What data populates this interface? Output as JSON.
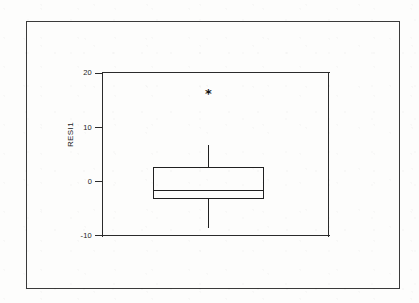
{
  "figure": {
    "background_color": "#fdfdfc",
    "ink_color": "#202020",
    "border_color": "#3a3a3a",
    "outlier_glyph": "*",
    "axis_title": "RESI1"
  },
  "chart_data": {
    "type": "box",
    "title": "",
    "xlabel": "",
    "ylabel": "RESI1",
    "ylim": [
      -10,
      20
    ],
    "yticks": [
      -10,
      0,
      10,
      20
    ],
    "ytick_labels": [
      "-10",
      "0",
      "10",
      "20"
    ],
    "grid": false,
    "legend": false,
    "orientation": "vertical",
    "categories": [
      ""
    ],
    "series": [
      {
        "name": "RESI1",
        "min_whisker": -8.7,
        "q1": -3.3,
        "median": -1.7,
        "q3": 2.6,
        "max_whisker": 6.7,
        "outliers": [
          16.5
        ]
      }
    ]
  }
}
